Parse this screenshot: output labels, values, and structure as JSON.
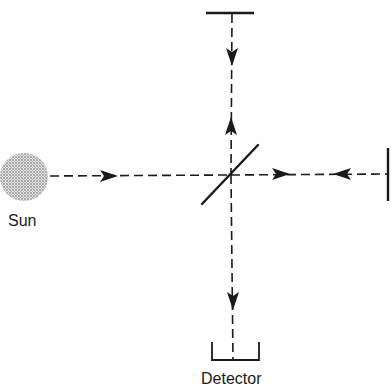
{
  "diagram": {
    "type": "Michelson interferometer (solar Fourier transform spectrometer)",
    "labels": {
      "source": "Sun",
      "detector": "Detector"
    },
    "components": [
      {
        "name": "Sun",
        "kind": "source",
        "shape": "stippled circle"
      },
      {
        "name": "beam splitter",
        "kind": "diagonal line at center"
      },
      {
        "name": "fixed mirror (top)",
        "kind": "horizontal bar"
      },
      {
        "name": "movable mirror (right)",
        "kind": "vertical bar"
      },
      {
        "name": "Detector",
        "kind": "cup/bracket"
      }
    ],
    "beams": [
      {
        "from": "Sun",
        "to": "beam splitter",
        "direction": "right"
      },
      {
        "from": "beam splitter",
        "to": "top mirror",
        "direction": "up"
      },
      {
        "from": "top mirror",
        "to": "beam splitter",
        "direction": "down"
      },
      {
        "from": "beam splitter",
        "to": "right mirror",
        "direction": "right"
      },
      {
        "from": "right mirror",
        "to": "beam splitter",
        "direction": "left"
      },
      {
        "from": "beam splitter",
        "to": "Detector",
        "direction": "down"
      }
    ],
    "colors": {
      "ink": "#1a1a1a",
      "sun_fill": "#bdbdbd",
      "background": "#ffffff"
    }
  }
}
